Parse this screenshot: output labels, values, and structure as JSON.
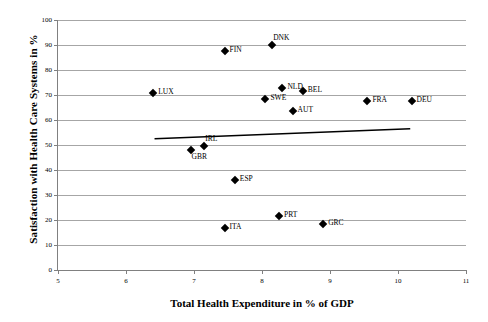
{
  "chart_data": {
    "type": "scatter",
    "title": "",
    "xlabel": "Total Health Expenditure in % of GDP",
    "ylabel": "Satisfaction with Health Care Systems in %",
    "xlim": [
      5,
      11
    ],
    "ylim": [
      0,
      100
    ],
    "xticks": [
      5,
      6,
      7,
      8,
      9,
      10,
      11
    ],
    "yticks": [
      0,
      10,
      20,
      30,
      40,
      50,
      60,
      70,
      80,
      90,
      100
    ],
    "grid": "horizontal",
    "legend": "none",
    "points": [
      {
        "label": "DNK",
        "x": 8.15,
        "y": 90.0,
        "label_pos": "above"
      },
      {
        "label": "FIN",
        "x": 7.45,
        "y": 87.5,
        "label_pos": "right"
      },
      {
        "label": "NLD",
        "x": 8.3,
        "y": 73.0,
        "label_pos": "right"
      },
      {
        "label": "BEL",
        "x": 8.6,
        "y": 71.5,
        "label_pos": "right"
      },
      {
        "label": "LUX",
        "x": 6.4,
        "y": 71.0,
        "label_pos": "right"
      },
      {
        "label": "SWE",
        "x": 8.05,
        "y": 68.5,
        "label_pos": "right"
      },
      {
        "label": "FRA",
        "x": 9.55,
        "y": 67.5,
        "label_pos": "right"
      },
      {
        "label": "DEU",
        "x": 10.2,
        "y": 67.5,
        "label_pos": "right"
      },
      {
        "label": "AUT",
        "x": 8.45,
        "y": 63.5,
        "label_pos": "right"
      },
      {
        "label": "IRL",
        "x": 7.15,
        "y": 49.5,
        "label_pos": "above"
      },
      {
        "label": "GBR",
        "x": 6.95,
        "y": 48.0,
        "label_pos": "below"
      },
      {
        "label": "ESP",
        "x": 7.6,
        "y": 36.0,
        "label_pos": "right"
      },
      {
        "label": "PRT",
        "x": 8.25,
        "y": 21.5,
        "label_pos": "right"
      },
      {
        "label": "GRC",
        "x": 8.9,
        "y": 18.5,
        "label_pos": "right"
      },
      {
        "label": "ITA",
        "x": 7.45,
        "y": 17.0,
        "label_pos": "right"
      }
    ],
    "trendline": {
      "x_start": 6.42,
      "y_start": 52.5,
      "x_end": 10.18,
      "y_end": 56.5,
      "color": "#000000"
    },
    "colors": {
      "marker": "#000000",
      "gridline": "#a6a6a6",
      "axis": "#808080",
      "text": "#000000",
      "background": "#ffffff"
    }
  }
}
